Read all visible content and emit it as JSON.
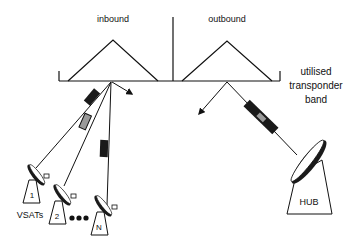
{
  "diagram": {
    "labels": {
      "inbound": "inbound",
      "outbound": "outbound",
      "band_line1": "utilised",
      "band_line2": "transponder",
      "band_line3": "band",
      "vsats": "VSATs",
      "hub": "HUB"
    },
    "terminals": [
      {
        "id": "1",
        "label": "1"
      },
      {
        "id": "2",
        "label": "2"
      },
      {
        "id": "N",
        "label": "N"
      }
    ],
    "ellipsis": "●●●",
    "colors": {
      "line": "#111111",
      "packet_dark": "#1a1a1a",
      "packet_gray": "#9a9a9a",
      "background": "#ffffff"
    }
  }
}
